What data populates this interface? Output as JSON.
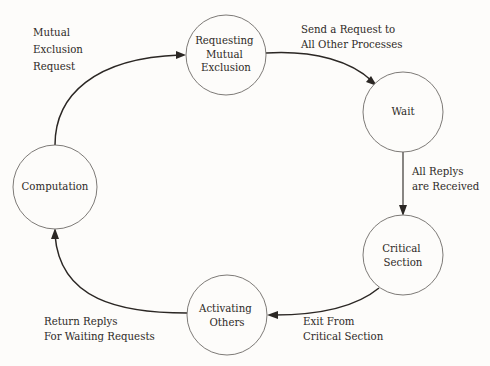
{
  "diagram": {
    "background_color": "#fdfcfa",
    "node_stroke_color": "#6e6b68",
    "edge_color": "#2b2724",
    "text_color": "#2e2a27",
    "nodes": [
      {
        "id": "computation",
        "label_lines": [
          "Computation"
        ],
        "cx": 55,
        "cy": 187,
        "r": 42
      },
      {
        "id": "requesting-mutual-exclusion",
        "label_lines": [
          "Requesting",
          "Mutual",
          "Exclusion"
        ],
        "cx": 226,
        "cy": 55,
        "r": 40
      },
      {
        "id": "wait",
        "label_lines": [
          "Wait"
        ],
        "cx": 403,
        "cy": 112,
        "r": 40
      },
      {
        "id": "critical-section",
        "label_lines": [
          "Critical",
          "Section"
        ],
        "cx": 403,
        "cy": 255,
        "r": 40
      },
      {
        "id": "activating-others",
        "label_lines": [
          "Activating",
          "Others"
        ],
        "cx": 227,
        "cy": 315,
        "r": 40
      }
    ],
    "edges": [
      {
        "id": "computation-to-requesting",
        "from": "computation",
        "to": "requesting-mutual-exclusion",
        "label_lines": [
          "Mutual",
          "Exclusion",
          "Request"
        ],
        "label_x": 33,
        "label_y": 36
      },
      {
        "id": "requesting-to-wait",
        "from": "requesting-mutual-exclusion",
        "to": "wait",
        "label_lines": [
          "Send a Request to",
          "All Other Processes"
        ],
        "label_x": 301,
        "label_y": 33
      },
      {
        "id": "wait-to-critical-section",
        "from": "wait",
        "to": "critical-section",
        "label_lines": [
          "All Replys",
          "are Received"
        ],
        "label_x": 412,
        "label_y": 175
      },
      {
        "id": "critical-section-to-activating",
        "from": "critical-section",
        "to": "activating-others",
        "label_lines": [
          "Exit From",
          "Critical Section"
        ],
        "label_x": 303,
        "label_y": 325
      },
      {
        "id": "activating-to-computation",
        "from": "activating-others",
        "to": "computation",
        "label_lines": [
          "Return Replys",
          "For Waiting Requests"
        ],
        "label_x": 44,
        "label_y": 325
      }
    ]
  }
}
